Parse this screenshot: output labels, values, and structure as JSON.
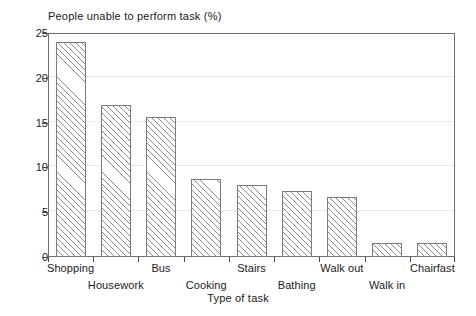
{
  "chart_data": {
    "type": "bar",
    "title": "People unable to perform task (%)",
    "xlabel": "Type of task",
    "ylabel": "",
    "categories": [
      "Shopping",
      "Housework",
      "Bus",
      "Cooking",
      "Stairs",
      "Bathing",
      "Walk out",
      "Walk in",
      "Chairfast"
    ],
    "values": [
      24.0,
      17.0,
      15.6,
      8.7,
      8.0,
      7.4,
      6.7,
      1.6,
      1.6
    ],
    "ylim": [
      0,
      25
    ],
    "yticks": [
      0,
      5,
      10,
      15,
      20,
      25
    ],
    "ytick_labels": [
      "0",
      "5",
      "10",
      "15",
      "20",
      "25"
    ],
    "grid": true,
    "legend": "none",
    "bar_fill": "diagonal-hatch",
    "bar_edge_color": "#7b7b7b",
    "hatch_color": "#8c8c8c",
    "background_color": "#ffffff",
    "axis_color": "#6d6d6d",
    "label_rows": [
      "top",
      "bottom",
      "top",
      "bottom",
      "top",
      "bottom",
      "top",
      "bottom",
      "top"
    ]
  }
}
